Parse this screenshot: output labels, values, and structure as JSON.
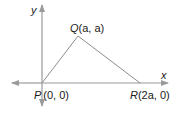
{
  "diagram": {
    "type": "coordinate-geometry-triangle",
    "axes": {
      "x_label": "x",
      "y_label": "y",
      "color": "#9a9a9a"
    },
    "triangle": {
      "edge_color": "#8c8c8c",
      "vertices": [
        {
          "name": "P",
          "coords": "(0, 0)"
        },
        {
          "name": "Q",
          "coords": "(a, a)"
        },
        {
          "name": "R",
          "coords": "(2a, 0)"
        }
      ]
    },
    "labels": {
      "P_name": "P",
      "P_coords": "(0, 0)",
      "Q_name": "Q",
      "Q_coords": "(a, a)",
      "R_name": "R",
      "R_coords": "(2a, 0)"
    }
  }
}
